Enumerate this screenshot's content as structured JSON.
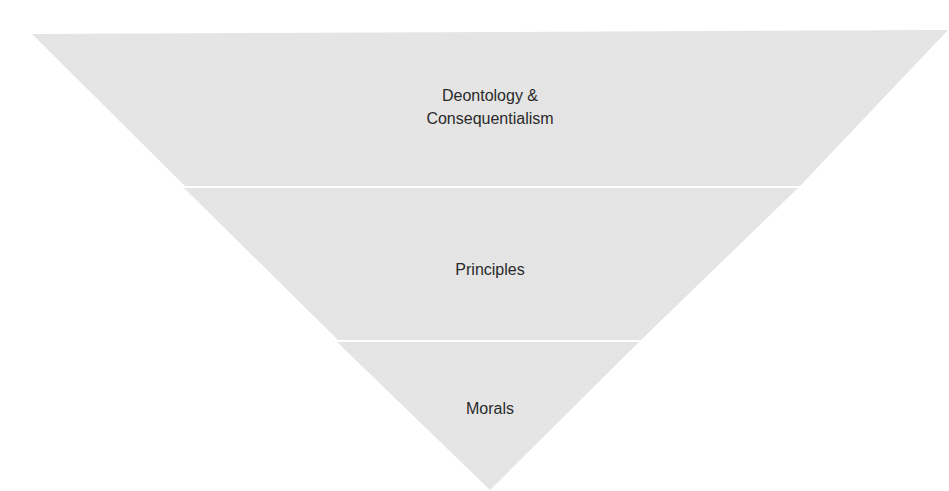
{
  "diagram": {
    "type": "inverted-pyramid",
    "fill_color": "#e6e6e6",
    "divider_color": "#ffffff",
    "text_color": "#2a2a2a",
    "levels": [
      {
        "label": "Deontology &\nConsequentialism",
        "line1": "Deontology &",
        "line2": "Consequentialism"
      },
      {
        "label": "Principles"
      },
      {
        "label": "Morals"
      }
    ]
  }
}
